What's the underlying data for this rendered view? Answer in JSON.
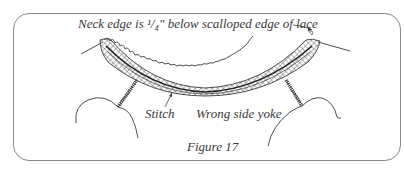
{
  "figure": {
    "caption": "Figure 17",
    "labels": {
      "neck_edge": "Neck edge is ¹/₄\" below scalloped edge of lace",
      "stitch": "Stitch",
      "wrong_side_yoke": "Wrong side yoke"
    },
    "colors": {
      "ink": "#3a3a3a",
      "frame": "#8a8a8a",
      "background": "#ffffff"
    }
  }
}
